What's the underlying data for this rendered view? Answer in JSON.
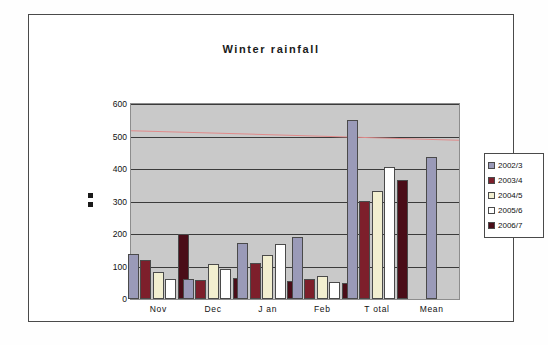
{
  "figure": {
    "title": "Winter rainfall"
  },
  "legend": {
    "position": "right",
    "entries": [
      {
        "label": "2002/3",
        "color": "#9a9ab8"
      },
      {
        "label": "2003/4",
        "color": "#7d1f2b"
      },
      {
        "label": "2004/5",
        "color": "#f2efd0"
      },
      {
        "label": "2005/6",
        "color": "#ffffff"
      },
      {
        "label": "2006/7",
        "color": "#4a0d18"
      }
    ]
  },
  "chart_data": {
    "type": "bar",
    "title": "Winter rainfall",
    "xlabel": "",
    "ylabel": "",
    "ylim": [
      0,
      600
    ],
    "yticks": [
      0,
      100,
      200,
      300,
      400,
      500,
      600
    ],
    "grid": true,
    "categories": [
      "Nov",
      "Dec",
      "J an",
      "Feb",
      "T otal",
      "Mean"
    ],
    "series": [
      {
        "name": "2002/3",
        "color": "#9a9ab8",
        "values": [
          140,
          62,
          172,
          192,
          552,
          437
        ]
      },
      {
        "name": "2003/4",
        "color": "#7d1f2b",
        "values": [
          120,
          58,
          110,
          63,
          303,
          null
        ]
      },
      {
        "name": "2004/5",
        "color": "#f2efd0",
        "values": [
          82,
          108,
          136,
          70,
          332,
          null
        ]
      },
      {
        "name": "2005/6",
        "color": "#ffffff",
        "values": [
          62,
          93,
          168,
          52,
          405,
          null
        ]
      },
      {
        "name": "2006/7",
        "color": "#4a0d18",
        "values": [
          201,
          66,
          56,
          50,
          366,
          null
        ]
      }
    ],
    "trendline": {
      "color": "#e08a8a",
      "start": 521,
      "end": 491
    }
  }
}
